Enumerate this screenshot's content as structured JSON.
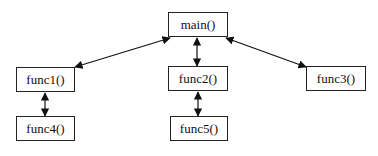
{
  "diagram": {
    "type": "call-graph",
    "nodes": [
      {
        "id": "main",
        "label": "main()",
        "x": 168,
        "y": 12,
        "w": 60,
        "h": 25
      },
      {
        "id": "func1",
        "label": "func1()",
        "x": 16,
        "y": 67,
        "w": 59,
        "h": 25
      },
      {
        "id": "func2",
        "label": "func2()",
        "x": 168,
        "y": 66,
        "w": 60,
        "h": 25
      },
      {
        "id": "func3",
        "label": "func3()",
        "x": 306,
        "y": 66,
        "w": 60,
        "h": 25
      },
      {
        "id": "func4",
        "label": "func4()",
        "x": 16,
        "y": 116,
        "w": 59,
        "h": 25
      },
      {
        "id": "func5",
        "label": "func5()",
        "x": 170,
        "y": 116,
        "w": 58,
        "h": 25
      }
    ],
    "edges": [
      {
        "from": "main",
        "to": "func1",
        "direction": "both"
      },
      {
        "from": "main",
        "to": "func2",
        "direction": "both"
      },
      {
        "from": "main",
        "to": "func3",
        "direction": "both"
      },
      {
        "from": "func1",
        "to": "func4",
        "direction": "both"
      },
      {
        "from": "func2",
        "to": "func5",
        "direction": "both"
      }
    ]
  }
}
